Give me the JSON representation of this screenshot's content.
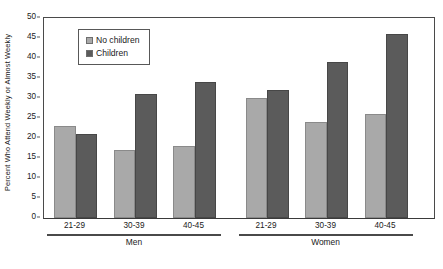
{
  "chart_data": {
    "type": "bar",
    "title": "",
    "xlabel": "",
    "ylabel": "Percent Who Attend Weekly or Almost Weekly",
    "ylim": [
      0,
      50
    ],
    "yticks": [
      0,
      5,
      10,
      15,
      20,
      25,
      30,
      35,
      40,
      45,
      50
    ],
    "grid": false,
    "legend_position": "inside top-left",
    "categories": [
      "21-29",
      "30-39",
      "40-45",
      "21-29",
      "30-39",
      "40-45"
    ],
    "groups": [
      {
        "label": "Men",
        "categories": [
          "21-29",
          "30-39",
          "40-45"
        ]
      },
      {
        "label": "Women",
        "categories": [
          "21-29",
          "30-39",
          "40-45"
        ]
      }
    ],
    "series": [
      {
        "name": "No children",
        "color": "#a9a9a9",
        "values": [
          23,
          17,
          18,
          30,
          24,
          26
        ]
      },
      {
        "name": "Children",
        "color": "#5b5b5b",
        "values": [
          21,
          31,
          34,
          32,
          39,
          46
        ]
      }
    ]
  },
  "legend": {
    "items": [
      {
        "label": "No children"
      },
      {
        "label": "Children"
      }
    ]
  },
  "axis": {
    "y_title": "Percent Who Attend Weekly or Almost Weekly",
    "y_tick_labels": [
      "50",
      "45",
      "40",
      "35",
      "30",
      "25",
      "20",
      "15",
      "10",
      "5",
      "0"
    ]
  }
}
